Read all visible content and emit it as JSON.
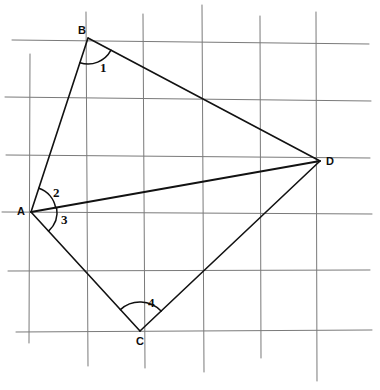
{
  "figure": {
    "canvas": {
      "width": 380,
      "height": 390,
      "background": "#ffffff"
    },
    "colors": {
      "grid": "#7a7a7a",
      "stroke": "#121212",
      "label": "#0d0d0d"
    },
    "vertices": [
      {
        "id": "B",
        "label": "B",
        "x": 88,
        "y": 38,
        "label_x": 78,
        "label_y": 34
      },
      {
        "id": "A",
        "label": "A",
        "x": 31,
        "y": 212,
        "label_x": 17,
        "label_y": 215
      },
      {
        "id": "C",
        "label": "C",
        "x": 140,
        "y": 331,
        "label_x": 136,
        "label_y": 345
      },
      {
        "id": "D",
        "label": "D",
        "x": 320,
        "y": 161,
        "label_x": 326,
        "label_y": 165
      }
    ],
    "edges": [
      {
        "name": "segment-BA",
        "from": "B",
        "to": "A"
      },
      {
        "name": "segment-BD",
        "from": "B",
        "to": "D"
      },
      {
        "name": "segment-AC",
        "from": "A",
        "to": "C"
      },
      {
        "name": "segment-CD",
        "from": "C",
        "to": "D"
      }
    ],
    "diagonals": [
      {
        "name": "segment-AD",
        "from": "A",
        "to": "D"
      }
    ],
    "angles": [
      {
        "id": "1",
        "label": "1",
        "vertex": "B",
        "between": [
          "A",
          "D"
        ],
        "radius": 26,
        "label_x": 100,
        "label_y": 72
      },
      {
        "id": "2",
        "label": "2",
        "vertex": "A",
        "between": [
          "B",
          "D"
        ],
        "radius": 25,
        "label_x": 53,
        "label_y": 197
      },
      {
        "id": "3",
        "label": "3",
        "vertex": "A",
        "between": [
          "D",
          "C"
        ],
        "radius": 26,
        "label_x": 61,
        "label_y": 224
      },
      {
        "id": "4",
        "label": "4",
        "vertex": "C",
        "between": [
          "A",
          "D"
        ],
        "radius": 29,
        "label_x": 148,
        "label_y": 307
      }
    ],
    "grid": {
      "description": "hand-drawn graph paper, slightly tilted rules",
      "horizontal": [
        {
          "name": "grid-row-1",
          "x1": 12,
          "y1": 40,
          "x2": 369,
          "y2": 44
        },
        {
          "name": "grid-row-2",
          "x1": 5,
          "y1": 97,
          "x2": 371,
          "y2": 101
        },
        {
          "name": "grid-row-3",
          "x1": 6,
          "y1": 155,
          "x2": 370,
          "y2": 158
        },
        {
          "name": "grid-row-4",
          "x1": 2,
          "y1": 212,
          "x2": 372,
          "y2": 214
        },
        {
          "name": "grid-row-5",
          "x1": 8,
          "y1": 271,
          "x2": 370,
          "y2": 270
        },
        {
          "name": "grid-row-6",
          "x1": 16,
          "y1": 332,
          "x2": 372,
          "y2": 330
        }
      ],
      "vertical": [
        {
          "name": "grid-col-1",
          "x1": 30,
          "y1": 54,
          "x2": 29,
          "y2": 343
        },
        {
          "name": "grid-col-2",
          "x1": 86,
          "y1": 12,
          "x2": 88,
          "y2": 366
        },
        {
          "name": "grid-col-3",
          "x1": 143,
          "y1": 14,
          "x2": 145,
          "y2": 368
        },
        {
          "name": "grid-col-4",
          "x1": 202,
          "y1": 5,
          "x2": 204,
          "y2": 372
        },
        {
          "name": "grid-col-5",
          "x1": 260,
          "y1": 16,
          "x2": 261,
          "y2": 358
        },
        {
          "name": "grid-col-6",
          "x1": 316,
          "y1": 12,
          "x2": 317,
          "y2": 381
        }
      ]
    }
  }
}
